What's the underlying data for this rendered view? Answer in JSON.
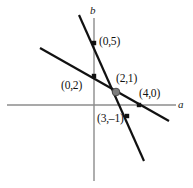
{
  "figure": {
    "kind": "coordinate-geometry-diagram",
    "width": 193,
    "height": 188,
    "background_color": "#ffffff"
  },
  "axes": {
    "horizontal": {
      "label": "a",
      "color": "#8c8c8c",
      "x1": 7,
      "y1": 105,
      "x2": 176,
      "y2": 105,
      "label_x": 178,
      "label_y": 99
    },
    "vertical": {
      "label": "b",
      "color": "#8c8c8c",
      "x1": 94,
      "y1": 18,
      "x2": 94,
      "y2": 181,
      "label_x": 90,
      "label_y": 5
    }
  },
  "lines": [
    {
      "name": "steep-line",
      "color": "#111111",
      "width": 2.2,
      "x1": 79,
      "y1": 15,
      "x2": 144,
      "y2": 161
    },
    {
      "name": "shallow-line",
      "color": "#111111",
      "width": 2.2,
      "x1": 40,
      "y1": 48,
      "x2": 169,
      "y2": 121
    }
  ],
  "points": [
    {
      "name": "point-0-5",
      "label": "(0,5)",
      "marker": "square",
      "marker_color": "#111111",
      "cx": 94,
      "cy": 43,
      "size": 4.4,
      "label_x": 99,
      "label_y": 36
    },
    {
      "name": "point-0-2",
      "label": "(0,2)",
      "marker": "square",
      "marker_color": "#111111",
      "cx": 94,
      "cy": 76,
      "size": 4.4,
      "label_x": 61,
      "label_y": 80
    },
    {
      "name": "point-2-1",
      "label": "(2,1)",
      "marker": "circle",
      "marker_color": "#7d7d7d",
      "cx": 116,
      "cy": 92,
      "size": 5.4,
      "label_x": 116,
      "label_y": 73
    },
    {
      "name": "point-4-0",
      "label": "(4,0)",
      "marker": "square",
      "marker_color": "#111111",
      "cx": 139,
      "cy": 105,
      "size": 4.4,
      "label_x": 139,
      "label_y": 88
    },
    {
      "name": "point-3-minus1",
      "label": "(3,–1)",
      "marker": "square",
      "marker_color": "#111111",
      "cx": 127,
      "cy": 116,
      "size": 4.4,
      "label_x": 97,
      "label_y": 113
    }
  ],
  "chart_data": {
    "type": "line",
    "title": "",
    "xlabel": "a",
    "ylabel": "b",
    "grid": false,
    "legend": null,
    "series": [
      {
        "name": "steep-line",
        "points": [
          [
            0,
            5
          ],
          [
            2,
            1
          ],
          [
            3,
            -1
          ]
        ],
        "annotations": [
          "(0,5)",
          "(2,1)",
          "(3,–1)"
        ]
      },
      {
        "name": "shallow-line",
        "points": [
          [
            0,
            2
          ],
          [
            2,
            1
          ],
          [
            4,
            0
          ]
        ],
        "annotations": [
          "(0,2)",
          "(2,1)",
          "(4,0)"
        ]
      }
    ],
    "intersection": [
      2,
      1
    ],
    "labeled_points": [
      "(0,5)",
      "(0,2)",
      "(2,1)",
      "(4,0)",
      "(3,–1)"
    ]
  }
}
